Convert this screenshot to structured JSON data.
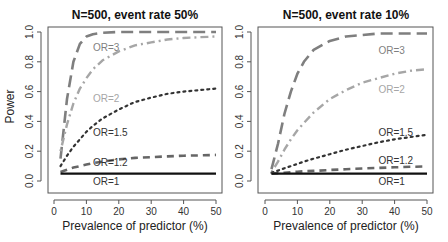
{
  "chart_data": [
    {
      "type": "line",
      "title": "N=500, event rate 50%",
      "xlabel": "Prevalence of predictor (%)",
      "ylabel": "Power",
      "xlim": [
        0,
        50
      ],
      "ylim": [
        0,
        1
      ],
      "xticks": [
        "0",
        "10",
        "20",
        "30",
        "40",
        "50"
      ],
      "yticks": [
        "0.0",
        "0.2",
        "0.4",
        "0.6",
        "0.8",
        "1.0"
      ],
      "grid": false,
      "x": [
        2,
        4,
        6,
        8,
        10,
        12,
        15,
        20,
        25,
        30,
        35,
        40,
        45,
        50
      ],
      "series": [
        {
          "name": "OR=3",
          "label": "OR=3",
          "style": "longdash",
          "color": "#7f7f7f",
          "values": [
            0.15,
            0.55,
            0.8,
            0.92,
            0.97,
            0.985,
            0.995,
            1.0,
            1.0,
            1.0,
            1.0,
            1.0,
            1.0,
            1.0
          ]
        },
        {
          "name": "OR=2",
          "label": "OR=2",
          "style": "dotdash",
          "color": "#a6a6a6",
          "values": [
            0.2,
            0.38,
            0.52,
            0.62,
            0.69,
            0.75,
            0.81,
            0.87,
            0.91,
            0.93,
            0.95,
            0.96,
            0.965,
            0.97
          ]
        },
        {
          "name": "OR=1.5",
          "label": "OR=1.5",
          "style": "dotted",
          "color": "#333333",
          "values": [
            0.1,
            0.17,
            0.23,
            0.28,
            0.33,
            0.37,
            0.42,
            0.48,
            0.53,
            0.56,
            0.585,
            0.6,
            0.61,
            0.62
          ]
        },
        {
          "name": "OR=1.2",
          "label": "OR=1.2",
          "style": "dashed",
          "color": "#666666",
          "values": [
            0.06,
            0.075,
            0.09,
            0.1,
            0.11,
            0.12,
            0.13,
            0.145,
            0.155,
            0.16,
            0.165,
            0.17,
            0.172,
            0.175
          ]
        },
        {
          "name": "OR=1",
          "label": "OR=1",
          "style": "solid",
          "color": "#111111",
          "values": [
            0.05,
            0.05,
            0.05,
            0.05,
            0.05,
            0.05,
            0.05,
            0.05,
            0.05,
            0.05,
            0.05,
            0.05,
            0.05,
            0.05
          ]
        }
      ]
    },
    {
      "type": "line",
      "title": "N=500, event rate 10%",
      "xlabel": "Prevalence of predictor (%)",
      "ylabel": "",
      "xlim": [
        0,
        50
      ],
      "ylim": [
        0,
        1
      ],
      "xticks": [
        "0",
        "10",
        "20",
        "30",
        "40",
        "50"
      ],
      "yticks": [
        "0.0",
        "0.2",
        "0.4",
        "0.6",
        "0.8",
        "1.0"
      ],
      "grid": false,
      "x": [
        2,
        4,
        6,
        8,
        10,
        12,
        15,
        20,
        25,
        30,
        35,
        40,
        45,
        50
      ],
      "series": [
        {
          "name": "OR=3",
          "label": "OR=3",
          "style": "longdash",
          "color": "#7f7f7f",
          "values": [
            0.08,
            0.25,
            0.45,
            0.6,
            0.72,
            0.8,
            0.88,
            0.94,
            0.97,
            0.98,
            0.99,
            0.99,
            0.99,
            0.99
          ]
        },
        {
          "name": "OR=2",
          "label": "OR=2",
          "style": "dotdash",
          "color": "#a6a6a6",
          "values": [
            0.06,
            0.13,
            0.21,
            0.28,
            0.34,
            0.39,
            0.46,
            0.55,
            0.61,
            0.66,
            0.69,
            0.72,
            0.74,
            0.75
          ]
        },
        {
          "name": "OR=1.5",
          "label": "OR=1.5",
          "style": "dotted",
          "color": "#333333",
          "values": [
            0.055,
            0.07,
            0.085,
            0.1,
            0.115,
            0.13,
            0.15,
            0.18,
            0.21,
            0.235,
            0.26,
            0.28,
            0.295,
            0.31
          ]
        },
        {
          "name": "OR=1.2",
          "label": "OR=1.2",
          "style": "dashed",
          "color": "#666666",
          "values": [
            0.05,
            0.053,
            0.056,
            0.059,
            0.062,
            0.065,
            0.068,
            0.074,
            0.079,
            0.084,
            0.088,
            0.092,
            0.095,
            0.098
          ]
        },
        {
          "name": "OR=1",
          "label": "OR=1",
          "style": "solid",
          "color": "#111111",
          "values": [
            0.05,
            0.05,
            0.05,
            0.05,
            0.05,
            0.05,
            0.05,
            0.05,
            0.05,
            0.05,
            0.05,
            0.05,
            0.05,
            0.05
          ]
        }
      ]
    }
  ]
}
